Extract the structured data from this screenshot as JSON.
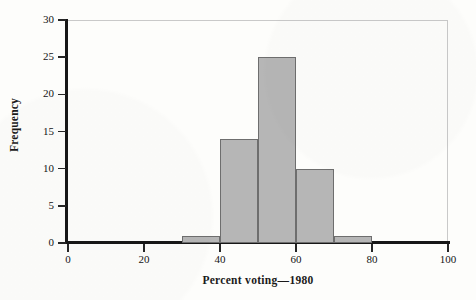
{
  "chart_data": {
    "type": "bar",
    "title": "",
    "xlabel": "Percent voting—1980",
    "ylabel": "Frequency",
    "xlim": [
      0,
      100
    ],
    "ylim": [
      0,
      30
    ],
    "grid": false,
    "legend": null,
    "bin_width": 10,
    "bin_edges": [
      30,
      40,
      50,
      60,
      70,
      80
    ],
    "categories": [
      "30–40",
      "40–50",
      "50–60",
      "60–70",
      "70–80"
    ],
    "values": [
      1,
      14,
      25,
      10,
      1
    ],
    "bars": [
      {
        "label": "30–40",
        "start": 30,
        "end": 40,
        "value": 1
      },
      {
        "label": "40–50",
        "start": 40,
        "end": 50,
        "value": 14
      },
      {
        "label": "50–60",
        "start": 50,
        "end": 60,
        "value": 25
      },
      {
        "label": "60–70",
        "start": 60,
        "end": 70,
        "value": 10
      },
      {
        "label": "70–80",
        "start": 70,
        "end": 80,
        "value": 1
      }
    ],
    "xticks": [
      0,
      20,
      40,
      60,
      80,
      100
    ],
    "xtick_labels": [
      "0",
      "20",
      "40",
      "60",
      "80",
      "100"
    ],
    "yticks": [
      0,
      5,
      10,
      15,
      20,
      25,
      30
    ],
    "ytick_labels": [
      "0",
      "5",
      "10",
      "15",
      "20",
      "25",
      "30"
    ],
    "colors": {
      "bar_fill": "#b6b6b6",
      "bar_stroke": "#6e6e6e",
      "axis": "#171717",
      "text": "#141414",
      "frame": "#c9c9c9",
      "background": "#fdfdfb"
    }
  }
}
